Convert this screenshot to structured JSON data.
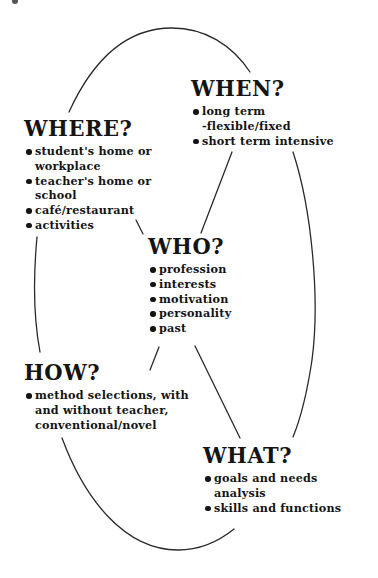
{
  "diagram": {
    "type": "cycle-mind-map",
    "nodes": {
      "when": {
        "heading": "WHEN?",
        "items": [
          "long term\n-flexible/fixed",
          "short term intensive"
        ]
      },
      "where": {
        "heading": "WHERE?",
        "items": [
          "student's home or\nworkplace",
          "teacher's home or\nschool",
          "café/restaurant",
          "activities"
        ]
      },
      "who": {
        "heading": "WHO?",
        "items": [
          "profession",
          "interests",
          "motivation",
          "personality",
          "past"
        ]
      },
      "how": {
        "heading": "HOW?",
        "items": [
          "method selections, with\nand without teacher,\nconventional/novel"
        ]
      },
      "what": {
        "heading": "WHAT?",
        "items": [
          "goals and needs\nanalysis",
          "skills and functions"
        ]
      }
    },
    "connections": [
      {
        "from": "where",
        "to": "when",
        "style": "arc"
      },
      {
        "from": "when",
        "to": "what",
        "style": "arc"
      },
      {
        "from": "what",
        "to": "how",
        "style": "arc"
      },
      {
        "from": "how",
        "to": "where",
        "style": "arc"
      },
      {
        "from": "when",
        "to": "who",
        "style": "line"
      },
      {
        "from": "where",
        "to": "who",
        "style": "line"
      },
      {
        "from": "who",
        "to": "how",
        "style": "line"
      },
      {
        "from": "who",
        "to": "what",
        "style": "line"
      }
    ],
    "colors": {
      "ink": "#141414",
      "line": "#2a2a2a",
      "background": "#ffffff"
    }
  }
}
